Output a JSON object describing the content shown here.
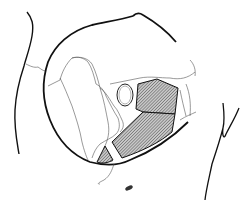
{
  "figure": {
    "type": "anatomical line drawing",
    "labels": [],
    "colors": {
      "background": "#ffffff",
      "outline": "#111111",
      "thin_line": "#444444",
      "hatch_fill": "#9a9a9a"
    },
    "regions": [
      {
        "name": "upper-hatched-region"
      },
      {
        "name": "lower-hatched-region"
      },
      {
        "name": "small-hatched-triangle"
      },
      {
        "name": "oval-foramen"
      }
    ]
  }
}
